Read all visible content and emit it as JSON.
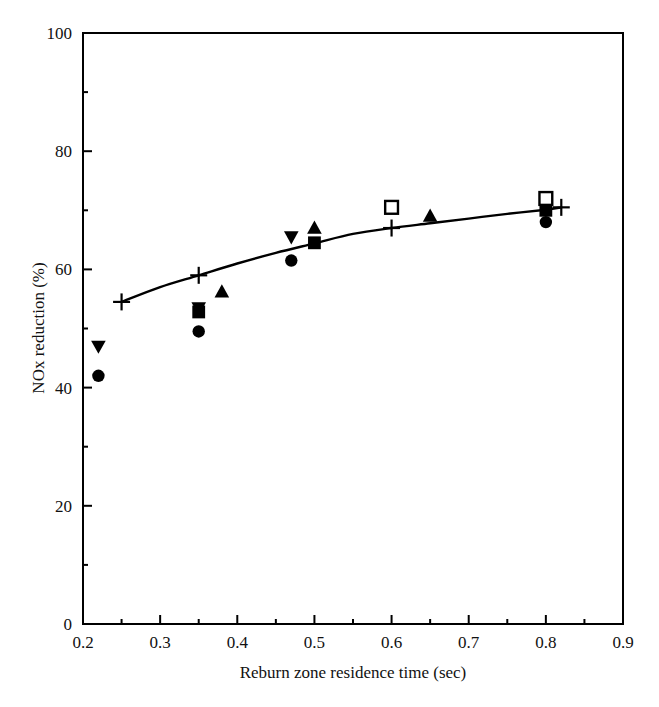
{
  "chart_data": {
    "type": "scatter",
    "title": "",
    "xlabel": "Reburn zone residence time (sec)",
    "ylabel": "NOx reduction (%)",
    "xlim": [
      0.2,
      0.9
    ],
    "ylim": [
      0,
      100
    ],
    "grid": false,
    "legend_position": "none",
    "x_ticks": [
      0.2,
      0.3,
      0.4,
      0.5,
      0.6,
      0.7,
      0.8,
      0.9
    ],
    "x_tick_labels": [
      "0.2",
      "0.3",
      "0.4",
      "0.5",
      "0.6",
      "0.7",
      "0.8",
      "0.9"
    ],
    "x_minor_tick_interval": 0.05,
    "y_ticks": [
      0,
      20,
      40,
      60,
      80,
      100
    ],
    "y_tick_labels": [
      "0",
      "20",
      "40",
      "60",
      "80",
      "100"
    ],
    "y_minor_tick_interval": 10,
    "series": [
      {
        "name": "filled-circle",
        "marker": "circle-filled",
        "color": "#000000",
        "points": [
          {
            "x": 0.22,
            "y": 42.0
          },
          {
            "x": 0.35,
            "y": 49.5
          },
          {
            "x": 0.47,
            "y": 61.5
          },
          {
            "x": 0.8,
            "y": 68.0
          }
        ]
      },
      {
        "name": "filled-down-triangle",
        "marker": "triangle-down-filled",
        "color": "#000000",
        "points": [
          {
            "x": 0.22,
            "y": 47.0
          },
          {
            "x": 0.35,
            "y": 53.5
          },
          {
            "x": 0.47,
            "y": 65.5
          }
        ]
      },
      {
        "name": "filled-square",
        "marker": "square-filled",
        "color": "#000000",
        "points": [
          {
            "x": 0.35,
            "y": 52.8
          },
          {
            "x": 0.5,
            "y": 64.5
          },
          {
            "x": 0.8,
            "y": 70.0
          }
        ]
      },
      {
        "name": "filled-up-triangle",
        "marker": "triangle-up-filled",
        "color": "#000000",
        "points": [
          {
            "x": 0.38,
            "y": 56.2
          },
          {
            "x": 0.5,
            "y": 67.0
          },
          {
            "x": 0.65,
            "y": 69.0
          }
        ]
      },
      {
        "name": "open-square",
        "marker": "square-open",
        "color": "#000000",
        "points": [
          {
            "x": 0.6,
            "y": 70.5
          },
          {
            "x": 0.8,
            "y": 72.0
          }
        ]
      },
      {
        "name": "plus-model",
        "marker": "plus",
        "color": "#000000",
        "line": true,
        "points": [
          {
            "x": 0.25,
            "y": 54.5
          },
          {
            "x": 0.35,
            "y": 59.0
          },
          {
            "x": 0.6,
            "y": 67.0
          },
          {
            "x": 0.82,
            "y": 70.5
          }
        ]
      }
    ],
    "trend_line": {
      "name": "model-curve",
      "color": "#000000",
      "points": [
        {
          "x": 0.25,
          "y": 54.5
        },
        {
          "x": 0.3,
          "y": 57.0
        },
        {
          "x": 0.35,
          "y": 59.0
        },
        {
          "x": 0.4,
          "y": 61.0
        },
        {
          "x": 0.45,
          "y": 62.8
        },
        {
          "x": 0.5,
          "y": 64.4
        },
        {
          "x": 0.55,
          "y": 66.0
        },
        {
          "x": 0.6,
          "y": 67.0
        },
        {
          "x": 0.65,
          "y": 67.8
        },
        {
          "x": 0.7,
          "y": 68.6
        },
        {
          "x": 0.75,
          "y": 69.4
        },
        {
          "x": 0.8,
          "y": 70.1
        },
        {
          "x": 0.82,
          "y": 70.5
        }
      ]
    }
  }
}
